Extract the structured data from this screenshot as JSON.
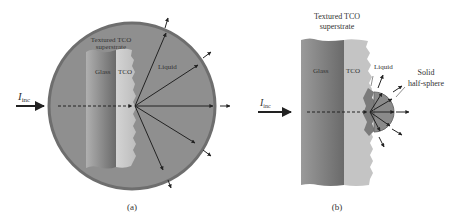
{
  "panel_a": {
    "caption": "(a)",
    "title_line1": "Textured TCO",
    "title_line2": "superstrate",
    "glass_label": "Glass",
    "tco_label": "TCO",
    "liquid_label": "Liquid",
    "incident_label": "I",
    "incident_sub": "inc"
  },
  "panel_b": {
    "caption": "(b)",
    "title_line1": "Textured TCO",
    "title_line2": "superstrate",
    "glass_label": "Glass",
    "tco_label": "TCO",
    "liquid_label": "Liquid",
    "solid_line1": "Solid",
    "solid_line2": "half-sphere",
    "incident_label": "I",
    "incident_sub": "inc"
  },
  "colors": {
    "sphere_fill": "#8f8f8f",
    "sphere_rim": "#6e6e6e",
    "glass_dark": "#6f6f6f",
    "glass_light": "#a9a9a9",
    "tco": "#c8c8c8",
    "arrow": "#222222"
  }
}
